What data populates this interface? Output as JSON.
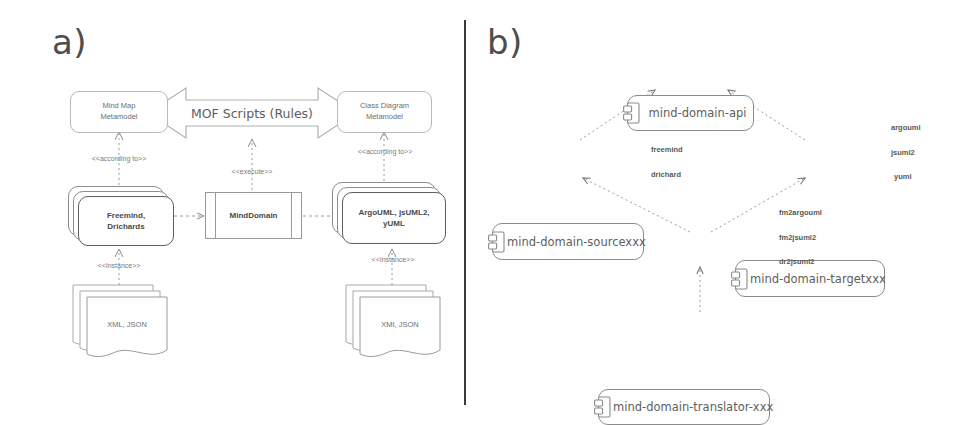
{
  "figure": {
    "width": 965,
    "height": 425,
    "background": "#ffffff",
    "line_color": "#8a8a8a",
    "text_color": "#5e5e5e",
    "divider_color": "#3a3a3a"
  },
  "panel_a": {
    "letter": "a)",
    "mof_arrow": {
      "label": "MOF Scripts (Rules)"
    },
    "metamodels": [
      {
        "id": "mindmap-metamodel",
        "line1": "Mind Map",
        "line2": "Metamodel"
      },
      {
        "id": "classdiagram-metamodel",
        "line1": "Class Diagram",
        "line2": "Metamodel"
      }
    ],
    "tools": [
      {
        "id": "source-tools",
        "line1": "Freemind,",
        "line2": "Drichards"
      },
      {
        "id": "target-tools",
        "line1": "ArgoUML, jsUML2,",
        "line2": "yUML"
      }
    ],
    "engine": {
      "id": "mind-domain-engine",
      "label": "MindDomain"
    },
    "documents": [
      {
        "id": "source-documents",
        "label": "XML, JSON"
      },
      {
        "id": "target-documents",
        "label": "XMI, JSON"
      }
    ],
    "stereotypes": {
      "according_to_left": "<<according to>>",
      "according_to_right": "<<according to>>",
      "execute": "<<execute>>",
      "instance_left": "<<Instance>>",
      "instance_right": "<<Instance>>"
    }
  },
  "panel_b": {
    "letter": "b)",
    "components": [
      {
        "id": "mind-domain-api",
        "label": "mind-domain-api"
      },
      {
        "id": "mind-domain-sourcexxx",
        "label": "mind-domain-sourcexxx"
      },
      {
        "id": "mind-domain-targetxxx",
        "label": "mind-domain-targetxxx"
      },
      {
        "id": "mind-domain-translator-xxx",
        "label": "mind-domain-translator-xxx"
      },
      {
        "id": "mind-domain-core",
        "label": "mind-domain-core"
      }
    ],
    "source_variants": [
      "freemind",
      "drichard"
    ],
    "target_variants": [
      "argouml",
      "jsuml2",
      "yuml"
    ],
    "translator_variants": [
      "fm2argouml",
      "fm2jsuml2",
      "dr2jsuml2"
    ]
  }
}
